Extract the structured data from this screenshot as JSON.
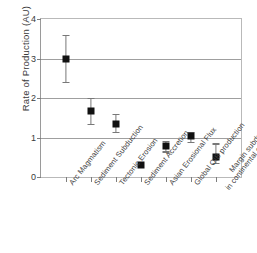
{
  "chart_data": {
    "type": "scatter",
    "title": "",
    "xlabel": "",
    "ylabel": "Rate of Production  (AU)",
    "ylim": [
      0,
      4
    ],
    "yticks": [
      "0",
      "1",
      "2",
      "3",
      "4"
    ],
    "ytick_values": [
      0,
      1,
      2,
      3,
      4
    ],
    "grid": true,
    "grid_axis": "y",
    "legend": "none",
    "marker": "filled-square",
    "marker_color": "#111111",
    "error_bar_color": "#787878",
    "categories": [
      "Arc Magmatism",
      "Sediment Subduction",
      "Tectonic Erosion",
      "Sediment Accretion",
      "Asian Erosional Flux",
      "Global OIB production",
      "Margin subduction in continental collisions"
    ],
    "category_lines": [
      [
        "Arc Magmatism"
      ],
      [
        "Sediment Subduction"
      ],
      [
        "Tectonic Erosion"
      ],
      [
        "Sediment Accretion"
      ],
      [
        "Asian Erosional Flux"
      ],
      [
        "Global OIB production"
      ],
      [
        "Margin subduction",
        "in continental collisions"
      ]
    ],
    "values": [
      3.0,
      1.67,
      1.35,
      0.3,
      0.78,
      1.03,
      0.5
    ],
    "err_low": [
      2.4,
      1.35,
      1.15,
      0.3,
      0.65,
      0.88,
      0.35
    ],
    "err_high": [
      3.6,
      2.0,
      1.6,
      0.3,
      0.92,
      1.15,
      0.85
    ],
    "points": [
      {
        "category": "Arc Magmatism",
        "value": 3.0,
        "low": 2.4,
        "high": 3.6
      },
      {
        "category": "Sediment Subduction",
        "value": 1.67,
        "low": 1.35,
        "high": 2.0
      },
      {
        "category": "Tectonic Erosion",
        "value": 1.35,
        "low": 1.15,
        "high": 1.6
      },
      {
        "category": "Sediment Accretion",
        "value": 0.3,
        "low": 0.3,
        "high": 0.3
      },
      {
        "category": "Asian Erosional Flux",
        "value": 0.78,
        "low": 0.65,
        "high": 0.92
      },
      {
        "category": "Global OIB production",
        "value": 1.03,
        "low": 0.88,
        "high": 1.15
      },
      {
        "category": "Margin subduction in continental collisions",
        "value": 0.5,
        "low": 0.35,
        "high": 0.85
      }
    ]
  }
}
